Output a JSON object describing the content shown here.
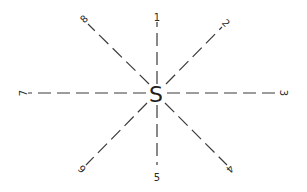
{
  "diagram": {
    "center": {
      "label": "S",
      "x": 156,
      "y": 94
    },
    "rays": [
      {
        "id": 1,
        "label": "1",
        "direction": "north",
        "x1": 157,
        "y1": 84,
        "x2": 157,
        "y2": 22,
        "lx": 157,
        "ly": 17,
        "rot": 0
      },
      {
        "id": 2,
        "label": "2",
        "direction": "northeast",
        "x1": 166,
        "y1": 84,
        "x2": 222,
        "y2": 27,
        "lx": 226,
        "ly": 23,
        "rot": 45
      },
      {
        "id": 3,
        "label": "3",
        "direction": "east",
        "x1": 167,
        "y1": 93,
        "x2": 278,
        "y2": 93,
        "lx": 283,
        "ly": 93,
        "rot": 90
      },
      {
        "id": 4,
        "label": "4",
        "direction": "southeast",
        "x1": 165,
        "y1": 103,
        "x2": 227,
        "y2": 165,
        "lx": 230,
        "ly": 169,
        "rot": 135
      },
      {
        "id": 5,
        "label": "5",
        "direction": "south",
        "x1": 157,
        "y1": 105,
        "x2": 157,
        "y2": 165,
        "lx": 157,
        "ly": 177,
        "rot": 0
      },
      {
        "id": 6,
        "label": "6",
        "direction": "southwest",
        "x1": 147,
        "y1": 103,
        "x2": 86,
        "y2": 165,
        "lx": 82,
        "ly": 169,
        "rot": 225
      },
      {
        "id": 7,
        "label": "7",
        "direction": "west",
        "x1": 146,
        "y1": 93,
        "x2": 28,
        "y2": 93,
        "lx": 23,
        "ly": 93,
        "rot": 270
      },
      {
        "id": 8,
        "label": "8",
        "direction": "northwest",
        "x1": 149,
        "y1": 84,
        "x2": 88,
        "y2": 24,
        "lx": 84,
        "ly": 19,
        "rot": 315
      }
    ],
    "colors": {
      "line": "#3a3a3a",
      "text": "#2a2a2a",
      "background": "#ffffff"
    }
  }
}
